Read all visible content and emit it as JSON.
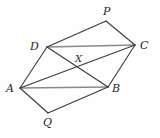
{
  "figure": {
    "background_color": "#fefefe",
    "stroke_color": "#3a3a3a",
    "stroke_color_light": "#8a8a8a",
    "label_color": "#262626",
    "labels": {
      "A": "A",
      "B": "B",
      "C": "C",
      "D": "D",
      "P": "P",
      "Q": "Q",
      "X": "X"
    }
  },
  "chart_data": {
    "type": "diagram",
    "points": [
      {
        "name": "A",
        "x": 20,
        "y": 88,
        "label_x": 6,
        "label_y": 83
      },
      {
        "name": "B",
        "x": 108,
        "y": 87,
        "label_x": 112,
        "label_y": 83
      },
      {
        "name": "C",
        "x": 135,
        "y": 45,
        "label_x": 140,
        "label_y": 40
      },
      {
        "name": "D",
        "x": 47,
        "y": 47,
        "label_x": 30,
        "label_y": 41
      },
      {
        "name": "P",
        "x": 106,
        "y": 21,
        "label_x": 103,
        "label_y": 6
      },
      {
        "name": "Q",
        "x": 48,
        "y": 113,
        "label_x": 43,
        "label_y": 117
      },
      {
        "name": "X",
        "x": 79,
        "y": 67,
        "label_x": 75,
        "label_y": 54
      }
    ],
    "segments": [
      {
        "from": "D",
        "to": "C",
        "style": "light"
      },
      {
        "from": "A",
        "to": "B",
        "style": "light"
      },
      {
        "from": "A",
        "to": "D",
        "style": "dark"
      },
      {
        "from": "B",
        "to": "C",
        "style": "dark"
      },
      {
        "from": "A",
        "to": "C",
        "style": "dark"
      },
      {
        "from": "D",
        "to": "B",
        "style": "dark"
      },
      {
        "from": "D",
        "to": "P",
        "style": "dark"
      },
      {
        "from": "P",
        "to": "C",
        "style": "dark"
      },
      {
        "from": "A",
        "to": "Q",
        "style": "dark"
      },
      {
        "from": "Q",
        "to": "B",
        "style": "dark"
      }
    ]
  }
}
